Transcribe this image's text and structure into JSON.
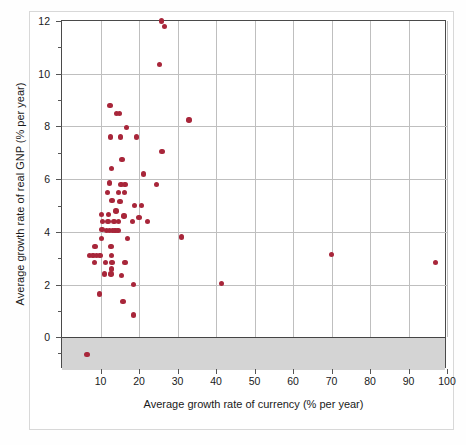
{
  "chart_data": {
    "type": "scatter",
    "title": "",
    "xlabel": "Average growth rate of currency (% per year)",
    "ylabel": "Average growth rate of real GNP (% per year)",
    "xlim": [
      0,
      100
    ],
    "ylim": [
      -1.2,
      12
    ],
    "xticks": [
      10,
      20,
      30,
      40,
      50,
      60,
      70,
      80,
      90,
      100
    ],
    "xtick_labels": [
      "10",
      "20",
      "30",
      "40",
      "50",
      "60",
      "70",
      "80",
      "90",
      "100"
    ],
    "yticks": [
      0,
      2,
      4,
      6,
      8,
      10,
      12
    ],
    "ytick_labels": [
      "0",
      "2",
      "4",
      "6",
      "8",
      "10",
      "12"
    ],
    "yminorticks": [
      1,
      3,
      5,
      7,
      9,
      11,
      -0.6
    ],
    "grid": "both",
    "grid_color": "#bfbfbf",
    "marker_color": "#a8263a",
    "negative_region_shaded": true,
    "negative_region_color": "#d4d4d4",
    "points": [
      [
        25.8,
        12.0
      ],
      [
        26.6,
        11.8
      ],
      [
        25.3,
        10.35
      ],
      [
        12.5,
        8.8
      ],
      [
        14.2,
        8.5
      ],
      [
        15.0,
        8.5
      ],
      [
        33.0,
        8.25
      ],
      [
        16.8,
        7.95
      ],
      [
        12.6,
        7.6
      ],
      [
        15.2,
        7.6
      ],
      [
        19.3,
        7.6
      ],
      [
        26.0,
        7.05
      ],
      [
        15.6,
        6.75
      ],
      [
        12.8,
        6.4
      ],
      [
        21.2,
        6.2
      ],
      [
        12.4,
        5.85
      ],
      [
        15.3,
        5.8
      ],
      [
        16.4,
        5.8
      ],
      [
        24.5,
        5.8
      ],
      [
        11.8,
        5.5
      ],
      [
        14.7,
        5.5
      ],
      [
        16.3,
        5.5
      ],
      [
        13.0,
        5.2
      ],
      [
        15.1,
        5.15
      ],
      [
        18.9,
        5.0
      ],
      [
        20.6,
        5.0
      ],
      [
        14.0,
        4.8
      ],
      [
        10.2,
        4.65
      ],
      [
        12.0,
        4.65
      ],
      [
        16.1,
        4.6
      ],
      [
        20.0,
        4.55
      ],
      [
        10.5,
        4.4
      ],
      [
        11.9,
        4.4
      ],
      [
        13.5,
        4.4
      ],
      [
        14.6,
        4.4
      ],
      [
        18.3,
        4.4
      ],
      [
        22.2,
        4.4
      ],
      [
        10.4,
        4.1
      ],
      [
        11.6,
        4.05
      ],
      [
        12.4,
        4.05
      ],
      [
        13.1,
        4.05
      ],
      [
        13.8,
        4.05
      ],
      [
        14.5,
        4.05
      ],
      [
        31.0,
        3.8
      ],
      [
        10.3,
        3.75
      ],
      [
        17.0,
        3.75
      ],
      [
        8.6,
        3.45
      ],
      [
        12.7,
        3.45
      ],
      [
        70.0,
        3.15
      ],
      [
        7.1,
        3.1
      ],
      [
        8.1,
        3.1
      ],
      [
        9.0,
        3.1
      ],
      [
        9.9,
        3.1
      ],
      [
        12.9,
        3.1
      ],
      [
        97.0,
        2.85
      ],
      [
        8.4,
        2.85
      ],
      [
        11.3,
        2.85
      ],
      [
        13.0,
        2.85
      ],
      [
        16.4,
        2.85
      ],
      [
        12.8,
        2.6
      ],
      [
        11.1,
        2.4
      ],
      [
        12.7,
        2.4
      ],
      [
        15.5,
        2.35
      ],
      [
        41.5,
        2.05
      ],
      [
        18.5,
        2.0
      ],
      [
        9.7,
        1.65
      ],
      [
        15.8,
        1.35
      ],
      [
        18.6,
        0.85
      ],
      [
        6.5,
        -0.65
      ]
    ]
  }
}
